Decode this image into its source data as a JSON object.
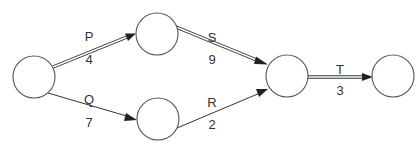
{
  "diagram": {
    "type": "activity-on-arrow network",
    "nodes": [
      {
        "id": "n1",
        "cx": 34,
        "cy": 77,
        "r": 21,
        "label": ""
      },
      {
        "id": "n2",
        "cx": 157,
        "cy": 34,
        "r": 21,
        "label": ""
      },
      {
        "id": "n3",
        "cx": 158,
        "cy": 119,
        "r": 21,
        "label": ""
      },
      {
        "id": "n4",
        "cx": 287,
        "cy": 76,
        "r": 21,
        "label": ""
      },
      {
        "id": "n5",
        "cx": 393,
        "cy": 76,
        "r": 21,
        "label": ""
      }
    ],
    "edges": [
      {
        "id": "P",
        "from": "n1",
        "to": "n2",
        "activity": "P",
        "duration": "4",
        "critical": true
      },
      {
        "id": "Q",
        "from": "n1",
        "to": "n3",
        "activity": "Q",
        "duration": "7",
        "critical": false
      },
      {
        "id": "S",
        "from": "n2",
        "to": "n4",
        "activity": "S",
        "duration": "9",
        "critical": true
      },
      {
        "id": "R",
        "from": "n3",
        "to": "n4",
        "activity": "R",
        "duration": "2",
        "critical": false
      },
      {
        "id": "T",
        "from": "n4",
        "to": "n5",
        "activity": "T",
        "duration": "3",
        "critical": true
      }
    ],
    "critical_path": [
      "P",
      "S",
      "T"
    ],
    "colors": {
      "stroke": "#333333",
      "node_stroke": "#555555",
      "background": "#ffffff"
    }
  },
  "labels": {
    "P": {
      "activity": "P",
      "duration": "4"
    },
    "Q": {
      "activity": "Q",
      "duration": "7"
    },
    "S": {
      "activity": "S",
      "duration": "9"
    },
    "R": {
      "activity": "R",
      "duration": "2"
    },
    "T": {
      "activity": "T",
      "duration": "3"
    }
  }
}
